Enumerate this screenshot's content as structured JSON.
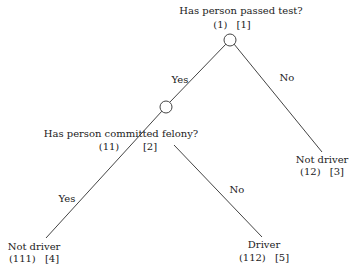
{
  "diagram": {
    "type": "decision-tree",
    "line_color": "#444444",
    "nodes": [
      {
        "id": "node-1",
        "kind": "decision",
        "label": "Has person passed test?",
        "path_code": "(1)",
        "node_number": "[1]"
      },
      {
        "id": "node-2",
        "kind": "decision",
        "label": "Has person committed felony?",
        "path_code": "(11)",
        "node_number": "[2]"
      },
      {
        "id": "node-3",
        "kind": "leaf",
        "label": "Not driver",
        "path_code": "(12)",
        "node_number": "[3]"
      },
      {
        "id": "node-4",
        "kind": "leaf",
        "label": "Not driver",
        "path_code": "(111)",
        "node_number": "[4]"
      },
      {
        "id": "node-5",
        "kind": "leaf",
        "label": "Driver",
        "path_code": "(112)",
        "node_number": "[5]"
      }
    ],
    "edges": [
      {
        "from": "node-1",
        "to": "node-2",
        "label": "Yes"
      },
      {
        "from": "node-1",
        "to": "node-3",
        "label": "No"
      },
      {
        "from": "node-2",
        "to": "node-4",
        "label": "Yes"
      },
      {
        "from": "node-2",
        "to": "node-5",
        "label": "No"
      }
    ]
  }
}
